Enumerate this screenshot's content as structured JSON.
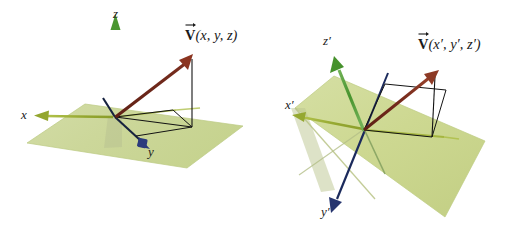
{
  "figure": {
    "background_color": "#ffffff",
    "width": 519,
    "height": 231
  },
  "colors": {
    "plane_fill": "#ccd79a",
    "plane_fill_right": "#cdd891",
    "plane_edge": "#b9c77f",
    "axis_green": "#5ea544",
    "axis_green_dark": "#3f8a2e",
    "axis_olive": "#9aad37",
    "axis_navy": "#1c2a5e",
    "axis_blue_head": "#2b3a7a",
    "vector_red": "#7c2d1e",
    "vector_red_head": "#8f3521",
    "projection_line": "#141414",
    "label_text": "#1a1a1a",
    "shadow": "#b5bf94"
  },
  "panels": [
    {
      "id": "unprimed-frame",
      "name": "left-diagram",
      "vector_label": {
        "symbol": "V",
        "args": "(x, y, z)",
        "full": "V(x, y, z)"
      },
      "axes": [
        {
          "name": "x-axis",
          "label": "x",
          "color": "#9aad37",
          "style": "olive arrow pointing left"
        },
        {
          "name": "y-axis",
          "label": "y",
          "color": "#1c2a5e",
          "style": "navy arrow pointing lower-right"
        },
        {
          "name": "z-axis",
          "label": "z",
          "color": "#5ea544",
          "style": "green vertical arrow pointing up"
        }
      ],
      "plane": {
        "name": "xy-plane",
        "label": ""
      },
      "vector": {
        "name": "vector-V",
        "color": "#7c2d1e"
      },
      "projections": [
        {
          "name": "vertical-drop-line"
        },
        {
          "name": "xy-projection-line"
        },
        {
          "name": "component-guide-line"
        }
      ]
    },
    {
      "id": "primed-frame",
      "name": "right-diagram",
      "vector_label": {
        "symbol": "V",
        "args": "(x', y', z')",
        "full": "V(x', y', z')"
      },
      "axes": [
        {
          "name": "x-prime-axis",
          "label": "x'",
          "color": "#9aad37",
          "style": "olive arrow pointing left"
        },
        {
          "name": "y-prime-axis",
          "label": "y'",
          "color": "#1c2a5e",
          "style": "navy arrow pointing lower-left"
        },
        {
          "name": "z-prime-axis",
          "label": "z'",
          "color": "#5ea544",
          "style": "green arrow pointing upper-left"
        }
      ],
      "plane": {
        "name": "xy-prime-plane",
        "label": ""
      },
      "vector": {
        "name": "vector-V-prime",
        "color": "#7c2d1e"
      },
      "projections": [
        {
          "name": "vertical-drop-line"
        },
        {
          "name": "xy-prime-projection-line"
        },
        {
          "name": "component-guide-line"
        }
      ]
    }
  ],
  "labels": {
    "left": {
      "z": "z",
      "x": "x",
      "y": "y",
      "vector_symbol": "V",
      "vector_args": "(x, y, z)"
    },
    "right": {
      "z_prime": "z′",
      "x_prime": "x′",
      "y_prime": "y′",
      "vector_symbol": "V",
      "vector_args": "(x′, y′, z′)"
    }
  }
}
